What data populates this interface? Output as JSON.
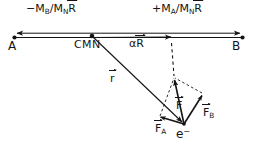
{
  "figure": {
    "type": "vector-force-diagram",
    "background_color": "#ffffff",
    "ink_color": "#141414",
    "width": 256,
    "height": 153
  },
  "labels": {
    "left_segment": {
      "sign": "−",
      "numerator": "M",
      "numerator_sub": "B",
      "denominator": "M",
      "denominator_sub": "N",
      "vector": "R"
    },
    "right_segment": {
      "sign": "+",
      "numerator": "M",
      "numerator_sub": "A",
      "denominator": "M",
      "denominator_sub": "N",
      "vector": "R"
    },
    "nucleus_a": "A",
    "nucleus_b": "B",
    "center_of_mass": "CMN",
    "alpha_r": {
      "scalar": "α",
      "vector": "R"
    },
    "position_vector": "r",
    "force_total": "F",
    "force_a": {
      "vector": "F",
      "sub": "A"
    },
    "force_b": {
      "vector": "F",
      "sub": "B"
    },
    "electron": {
      "symbol": "e",
      "charge": "−"
    }
  },
  "geometry": {
    "axis_y": 35,
    "axis_x_start": 14,
    "axis_x_end": 243,
    "point_a": {
      "x": 14,
      "y": 35
    },
    "point_b": {
      "x": 243,
      "y": 35
    },
    "point_cmn": {
      "x": 92,
      "y": 35
    },
    "alpha_r_head": {
      "x": 171,
      "y": 35
    },
    "electron": {
      "x": 184,
      "y": 124
    },
    "force_f_head": {
      "x": 174,
      "y": 78
    },
    "force_a_head": {
      "x": 158,
      "y": 118
    },
    "force_b_head": {
      "x": 203,
      "y": 94
    },
    "parallelogram_apex": {
      "x": 174,
      "y": 78
    }
  },
  "vectors": [
    {
      "name": "minus-MB-over-MN-R",
      "from": "CMN",
      "to": "A",
      "style": "solid-arrow"
    },
    {
      "name": "plus-MA-over-MN-R",
      "from": "CMN",
      "to": "B",
      "style": "solid-arrow"
    },
    {
      "name": "alpha-R",
      "from": "CMN",
      "to": "alpha_r_head",
      "style": "solid-arrow"
    },
    {
      "name": "r",
      "from": "CMN",
      "to": "electron",
      "style": "solid-arrow"
    },
    {
      "name": "F",
      "from": "electron",
      "to": "force_f_head",
      "style": "solid-arrow"
    },
    {
      "name": "F-A",
      "from": "electron",
      "to": "force_a_head",
      "style": "solid-arrow"
    },
    {
      "name": "F-B",
      "from": "electron",
      "to": "force_b_head",
      "style": "solid-arrow"
    },
    {
      "name": "projection-dashed",
      "from": "alpha_r_head",
      "to": "force_f_head",
      "style": "dashed"
    },
    {
      "name": "parallelogram-side-a",
      "from": "force_a_head",
      "to": "force_f_head",
      "style": "dashed"
    },
    {
      "name": "parallelogram-side-b",
      "from": "force_b_head",
      "to": "force_f_head",
      "style": "dashed"
    }
  ]
}
